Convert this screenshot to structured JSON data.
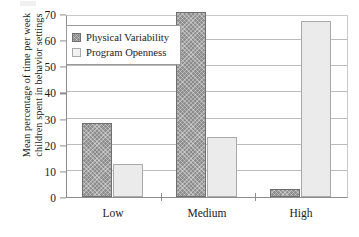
{
  "chart_data": {
    "type": "bar",
    "title": "",
    "xlabel": "",
    "ylabel_lines": [
      "Mean percentage of time per week",
      "children spent in behavior settings"
    ],
    "categories": [
      "Low",
      "Medium",
      "High"
    ],
    "series": [
      {
        "name": "Physical Variability",
        "values": [
          28.3,
          71.0,
          3.0
        ],
        "color": "#8c8c8c"
      },
      {
        "name": "Program Openness",
        "values": [
          12.5,
          23.1,
          67.5
        ],
        "color": "#ebebeb"
      }
    ],
    "ylim": [
      0,
      70
    ],
    "yticks": [
      0,
      10,
      20,
      30,
      40,
      50,
      60,
      70
    ],
    "ytick_labels": [
      "0",
      "10",
      "20",
      "30",
      "40",
      "50",
      "60",
      "70"
    ],
    "grid": "horizontal",
    "legend_position": "upper-left-inside"
  },
  "legend": {
    "items": [
      {
        "label": "Physical Variability",
        "swatch": "dark-hatched-swatch"
      },
      {
        "label": "Program Openness",
        "swatch": "light-swatch"
      }
    ]
  }
}
